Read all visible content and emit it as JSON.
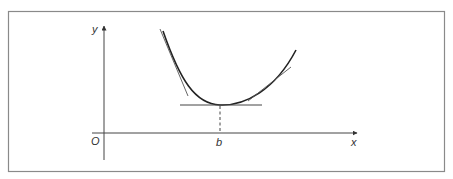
{
  "figure": {
    "labels": {
      "y_axis": "y",
      "x_axis": "x",
      "origin": "O",
      "min_point": "b"
    },
    "colors": {
      "frame": "#8a8a8a",
      "lines": "#444444",
      "curve": "#222222",
      "background": "#ffffff"
    }
  }
}
